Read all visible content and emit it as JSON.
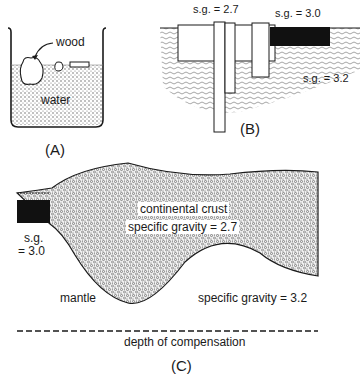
{
  "figure": {
    "panels": [
      {
        "id": "A",
        "caption": "(A)",
        "labels": {
          "wood": "wood",
          "water": "water"
        }
      },
      {
        "id": "B",
        "caption": "(B)",
        "labels": {
          "sg_light": "s.g. = 2.7",
          "sg_dark": "s.g. = 3.0",
          "sg_substrate": "s.g. = 3.2"
        }
      },
      {
        "id": "C",
        "caption": "(C)",
        "labels": {
          "crust_line1": "continental crust",
          "crust_line2": "specific gravity = 2.7",
          "oceanic_line1": "s.g.",
          "oceanic_line2": "= 3.0",
          "mantle": "mantle",
          "mantle_sg": "specific gravity = 3.2",
          "compensation": "depth of compensation"
        }
      }
    ],
    "colors": {
      "ink": "#1a1a1a",
      "fill_dark": "#111111",
      "stipple": "#8a8a8a",
      "background": "#ffffff"
    }
  }
}
